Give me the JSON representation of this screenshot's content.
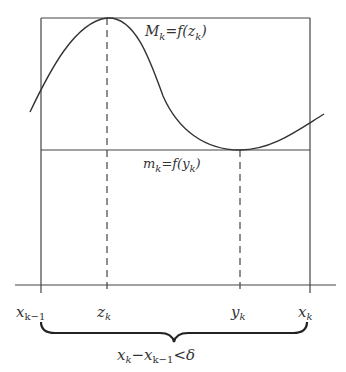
{
  "diagram": {
    "colors": {
      "stroke": "#333333",
      "background": "#ffffff"
    },
    "max_label": {
      "main": "M",
      "sub": "k",
      "eq": "=f(",
      "var": "z",
      "vsub": "k",
      "close": ")"
    },
    "min_label": {
      "main": "m",
      "sub": "k",
      "eq": "=f(",
      "var": "y",
      "vsub": "k",
      "close": ")"
    },
    "axis_labels": [
      {
        "main": "x",
        "sub": "k−1"
      },
      {
        "main": "z",
        "sub": "k"
      },
      {
        "main": "y",
        "sub": "k"
      },
      {
        "main": "x",
        "sub": "k"
      }
    ],
    "brace_label": {
      "a": "x",
      "asub": "k",
      "minus": "−x",
      "bsub": "k−1",
      "rel": "<δ"
    }
  }
}
